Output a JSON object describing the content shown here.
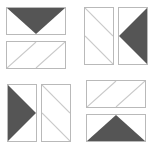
{
  "figure": {
    "stroke_color": "#b9b9b9",
    "fill_color": "#555555",
    "diagonal_color": "#c9c9c9",
    "background_color": "#ffffff",
    "tile_count": 8,
    "group_count": 4
  },
  "groups": [
    {
      "id": "group-1",
      "position": "top-left",
      "orientation": "stacked",
      "tiles": [
        {
          "id": "tile-1",
          "shape": "rectangle-horizontal",
          "motif": "filled-triangle",
          "motif_direction": "down",
          "label": "downward triangle"
        },
        {
          "id": "tile-2",
          "shape": "rectangle-horizontal",
          "motif": "parallel-diagonals",
          "motif_direction": "up-right",
          "label": "two parallel diagonals"
        }
      ]
    },
    {
      "id": "group-2",
      "position": "top-right",
      "orientation": "side-by-side",
      "tiles": [
        {
          "id": "tile-3",
          "shape": "rectangle-vertical",
          "motif": "parallel-diagonals",
          "motif_direction": "down-right",
          "label": "two parallel diagonals"
        },
        {
          "id": "tile-4",
          "shape": "rectangle-vertical",
          "motif": "filled-triangle",
          "motif_direction": "left",
          "label": "left-pointing triangle"
        }
      ]
    },
    {
      "id": "group-3",
      "position": "bottom-left",
      "orientation": "side-by-side",
      "tiles": [
        {
          "id": "tile-5",
          "shape": "rectangle-vertical",
          "motif": "filled-triangle",
          "motif_direction": "right",
          "label": "right-pointing triangle"
        },
        {
          "id": "tile-6",
          "shape": "rectangle-vertical",
          "motif": "parallel-diagonals",
          "motif_direction": "down-right",
          "label": "two parallel diagonals"
        }
      ]
    },
    {
      "id": "group-4",
      "position": "bottom-right",
      "orientation": "stacked",
      "tiles": [
        {
          "id": "tile-7",
          "shape": "rectangle-horizontal",
          "motif": "parallel-diagonals",
          "motif_direction": "up-right",
          "label": "two parallel diagonals"
        },
        {
          "id": "tile-8",
          "shape": "rectangle-horizontal",
          "motif": "filled-triangle",
          "motif_direction": "up",
          "label": "upward triangle"
        }
      ]
    }
  ]
}
